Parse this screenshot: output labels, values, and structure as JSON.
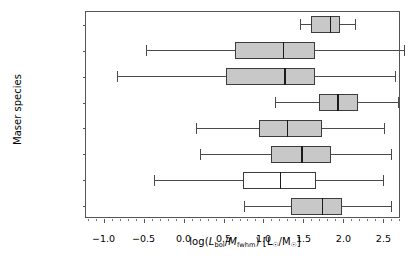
{
  "chart_data": {
    "type": "box",
    "orientation": "horizontal",
    "title": "",
    "xlabel": "log(L_bol/M_fwhm) [L_⊙/M_⊙]",
    "ylabel": "Maser species",
    "xlim": [
      -1.22,
      2.72
    ],
    "xticks": [
      -1.0,
      -0.5,
      0.0,
      0.5,
      1.0,
      1.5,
      2.0,
      2.5
    ],
    "xticklabels": [
      "−1.0",
      "−0.5",
      "0.0",
      "0.5",
      "1.0",
      "1.5",
      "2.0",
      "2.5"
    ],
    "grid": false,
    "legend": null,
    "categories": [
      "104.3 GHz",
      "95 GHz",
      "84 GHz",
      "107 GHz",
      "6.7 GHz",
      "12.2 GHz",
      "H₂O",
      "1665 OH"
    ],
    "boxes": [
      {
        "label": "104.3 GHz",
        "whisker_low": 1.46,
        "q1": 1.6,
        "median": 1.84,
        "q3": 1.96,
        "whisker_high": 2.15,
        "fill": "#c8c8c8"
      },
      {
        "label": "95 GHz",
        "whisker_low": -0.47,
        "q1": 0.64,
        "median": 1.25,
        "q3": 1.65,
        "whisker_high": 2.76,
        "fill": "#c8c8c8"
      },
      {
        "label": "84 GHz",
        "whisker_low": -0.83,
        "q1": 0.53,
        "median": 1.27,
        "q3": 1.64,
        "whisker_high": 2.65,
        "fill": "#c8c8c8"
      },
      {
        "label": "107 GHz",
        "whisker_low": 1.15,
        "q1": 1.7,
        "median": 1.93,
        "q3": 2.18,
        "whisker_high": 2.68,
        "fill": "#c8c8c8"
      },
      {
        "label": "6.7 GHz",
        "whisker_low": 0.15,
        "q1": 0.94,
        "median": 1.3,
        "q3": 1.73,
        "whisker_high": 2.51,
        "fill": "#c8c8c8"
      },
      {
        "label": "12.2 GHz",
        "whisker_low": 0.21,
        "q1": 1.09,
        "median": 1.48,
        "q3": 1.85,
        "whisker_high": 2.59,
        "fill": "#c8c8c8"
      },
      {
        "label": "H₂O",
        "whisker_low": -0.37,
        "q1": 0.74,
        "median": 1.21,
        "q3": 1.66,
        "whisker_high": 2.49,
        "fill": "#ffffff"
      },
      {
        "label": "1665 OH",
        "whisker_low": 0.75,
        "q1": 1.35,
        "median": 1.74,
        "q3": 1.98,
        "whisker_high": 2.59,
        "fill": "#c8c8c8"
      }
    ]
  },
  "colors": {
    "box_fill": "#c8c8c8",
    "box_fill_open": "#ffffff",
    "box_edge": "#3c3c3c",
    "median": "#1a1a1a",
    "whisker": "#4a4a4a",
    "axes_frame": "#555555",
    "background": "#ffffff"
  }
}
